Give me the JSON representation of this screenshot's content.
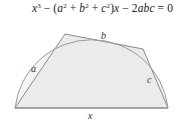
{
  "equation": {
    "x": "x",
    "pow3": "3",
    "minus1": " − (",
    "a": "a",
    "pow2a": "2",
    "plus1": " + ",
    "b": "b",
    "pow2b": "2",
    "plus2": " + ",
    "c": "c",
    "pow2c": "2",
    "close": ")",
    "x2": "x",
    "minus2": " − 2",
    "abc": "abc",
    "eq": " = 0"
  },
  "diagram": {
    "labels": {
      "a": "a",
      "b": "b",
      "c": "c",
      "x": "x"
    },
    "colors": {
      "fill": "#ececec",
      "stroke": "#888888",
      "arc": "#9a9a9a"
    }
  }
}
